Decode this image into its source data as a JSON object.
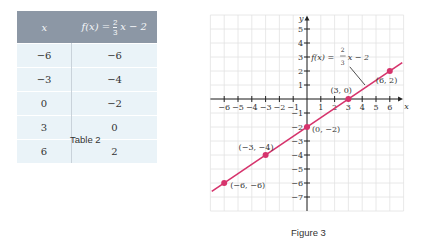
{
  "table": {
    "caption": "Table 2",
    "headers": [
      "x",
      "f(x) = (2/3)x − 2"
    ],
    "header_parts": {
      "x": "x",
      "fx": "f(x) =",
      "num": "2",
      "den": "3",
      "rest": "x − 2"
    },
    "rows": [
      {
        "x": "−6",
        "fx": "−6"
      },
      {
        "x": "−3",
        "fx": "−4"
      },
      {
        "x": "0",
        "fx": "−2"
      },
      {
        "x": "3",
        "fx": "0"
      },
      {
        "x": "6",
        "fx": "2"
      }
    ],
    "header_color": "#8c97a5",
    "row_color": "#eaf3f8"
  },
  "figure": {
    "caption": "Figure 3",
    "line_color": "#d6336c",
    "axis_labels": {
      "x": "x",
      "y": "y"
    },
    "equation_label": "f(x) = (2/3)x − 2",
    "point_labels": [
      "(−6, −6)",
      "(−3, −4)",
      "(0, −2)",
      "(3, 0)",
      "(6, 2)"
    ]
  },
  "chart_data": {
    "type": "line",
    "title": "Figure 3",
    "xlabel": "x",
    "ylabel": "y",
    "xlim": [
      -7,
      7
    ],
    "ylim": [
      -8,
      6
    ],
    "x_ticks": [
      -6,
      -5,
      -4,
      -3,
      -2,
      -1,
      1,
      2,
      3,
      4,
      5,
      6
    ],
    "y_ticks": [
      -7,
      -6,
      -5,
      -4,
      -3,
      -2,
      -1,
      1,
      2,
      3,
      4,
      5
    ],
    "grid": true,
    "series": [
      {
        "name": "f(x) = (2/3)x − 2",
        "x": [
          -6,
          -3,
          0,
          3,
          6
        ],
        "y": [
          -6,
          -4,
          -2,
          0,
          2
        ]
      }
    ],
    "annotations": [
      "(−6, −6)",
      "(−3, −4)",
      "(0, −2)",
      "(3, 0)",
      "(6, 2)",
      "f(x) = (2/3)x − 2"
    ]
  }
}
